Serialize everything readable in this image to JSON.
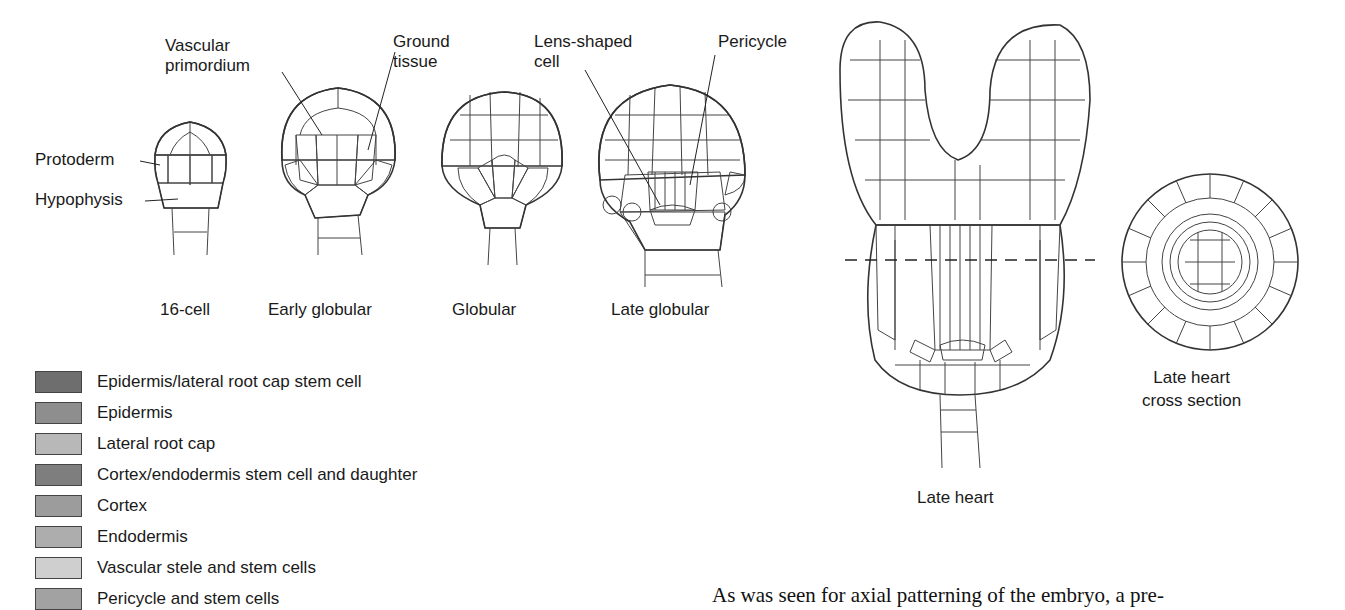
{
  "callouts": {
    "vascular_primordium": [
      "Vascular",
      "primordium"
    ],
    "ground_tissue": [
      "Ground",
      "tissue"
    ],
    "lens_shaped_cell": [
      "Lens-shaped",
      "cell"
    ],
    "pericycle": "Pericycle",
    "protoderm": "Protoderm",
    "hypophysis": "Hypophysis"
  },
  "stages": [
    {
      "label": "16-cell"
    },
    {
      "label": "Early globular"
    },
    {
      "label": "Globular"
    },
    {
      "label": "Late globular"
    },
    {
      "label": "Late heart"
    },
    {
      "label": [
        "Late heart",
        "cross section"
      ]
    }
  ],
  "legend": [
    {
      "label": "Epidermis/lateral root cap stem cell",
      "color": "#6e6e6e"
    },
    {
      "label": "Epidermis",
      "color": "#8e8e8e"
    },
    {
      "label": "Lateral root cap",
      "color": "#b8b8b8"
    },
    {
      "label": "Cortex/endodermis stem cell and daughter",
      "color": "#7e7e7e"
    },
    {
      "label": "Cortex",
      "color": "#9c9c9c"
    },
    {
      "label": "Endodermis",
      "color": "#adadad"
    },
    {
      "label": "Vascular stele and stem cells",
      "color": "#cfcfcf"
    },
    {
      "label": "Pericycle and stem cells",
      "color": "#a2a2a2"
    }
  ],
  "body_text": "As was seen for axial patterning of the embryo, a pre-"
}
